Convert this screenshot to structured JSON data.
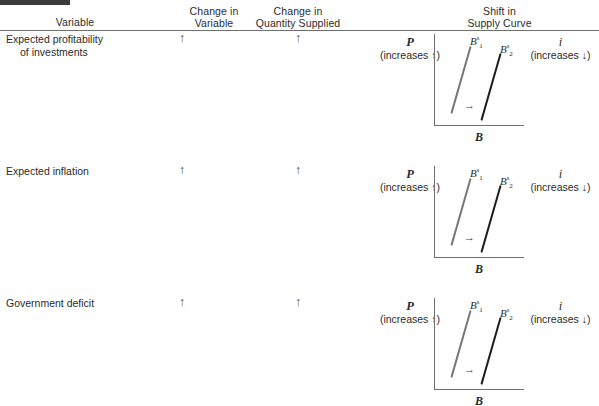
{
  "table": {
    "headers": [
      {
        "line1": "Variable",
        "line2": ""
      },
      {
        "line1": "Change in",
        "line2": "Variable"
      },
      {
        "line1": "Change in",
        "line2": "Quantity Supplied"
      },
      {
        "line1": "Shift in",
        "line2": "Supply Curve"
      }
    ],
    "rows": [
      {
        "variable_line1": "Expected profitability",
        "variable_line2": "of investments",
        "change_in_variable": "↑",
        "change_in_quantity_supplied": "↑",
        "diagram": {
          "y_axis_symbol": "P",
          "y_axis_note": "(increases ↑)",
          "x_axis_symbol": "B",
          "right_symbol": "i",
          "right_note": "(increases ↓)",
          "curve1_label": "B",
          "curve1_sup": "s",
          "curve1_sub": "1",
          "curve2_label": "B",
          "curve2_sup": "s",
          "curve2_sub": "2",
          "shift_arrow": "→"
        }
      },
      {
        "variable_line1": "Expected inflation",
        "variable_line2": "",
        "change_in_variable": "↑",
        "change_in_quantity_supplied": "↑",
        "diagram": {
          "y_axis_symbol": "P",
          "y_axis_note": "(increases ↑)",
          "x_axis_symbol": "B",
          "right_symbol": "i",
          "right_note": "(increases ↓)",
          "curve1_label": "B",
          "curve1_sup": "s",
          "curve1_sub": "1",
          "curve2_label": "B",
          "curve2_sup": "s",
          "curve2_sub": "2",
          "shift_arrow": "→"
        }
      },
      {
        "variable_line1": "Government deficit",
        "variable_line2": "",
        "change_in_variable": "↑",
        "change_in_quantity_supplied": "↑",
        "diagram": {
          "y_axis_symbol": "P",
          "y_axis_note": "(increases ↑)",
          "x_axis_symbol": "B",
          "right_symbol": "i",
          "right_note": "(increases ↓)",
          "curve1_label": "B",
          "curve1_sup": "s",
          "curve1_sub": "1",
          "curve2_label": "B",
          "curve2_sup": "s",
          "curve2_sub": "2",
          "shift_arrow": "→"
        }
      }
    ]
  },
  "colors": {
    "text": "#2b2b2b",
    "rule": "#6f6f6f",
    "curve_initial": "#777777",
    "curve_shifted": "#1d1d1d",
    "corner_bar": "#3b3b3b"
  }
}
